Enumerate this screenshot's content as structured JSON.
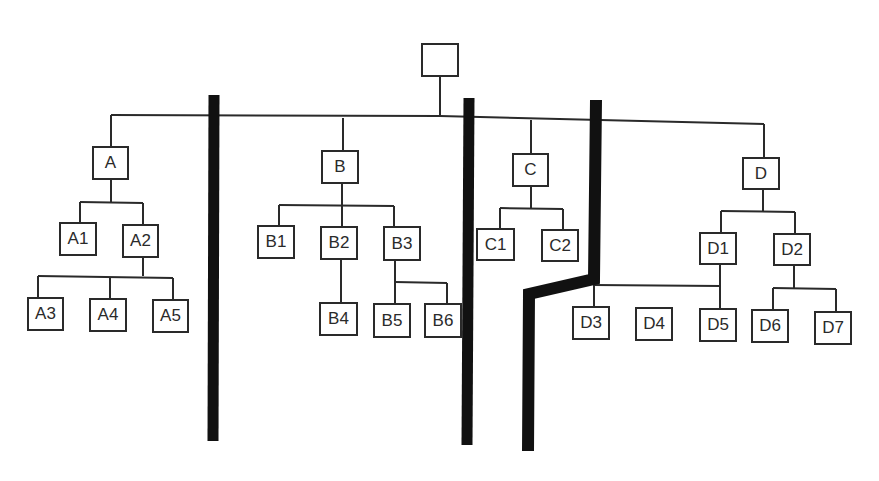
{
  "diagram": {
    "type": "org-chart-partitioned",
    "colors": {
      "line": "#2a2a2a",
      "divider": "#111111",
      "background": "#ffffff"
    },
    "root": {
      "id": "root",
      "label": "",
      "x": 421,
      "y": 43,
      "w": 38,
      "h": 34
    },
    "nodes": [
      {
        "id": "A",
        "label": "A",
        "x": 92,
        "y": 146,
        "w": 37,
        "h": 34
      },
      {
        "id": "A1",
        "label": "A1",
        "x": 59,
        "y": 222,
        "w": 38,
        "h": 34
      },
      {
        "id": "A2",
        "label": "A2",
        "x": 122,
        "y": 224,
        "w": 37,
        "h": 34
      },
      {
        "id": "A3",
        "label": "A3",
        "x": 27,
        "y": 297,
        "w": 37,
        "h": 34
      },
      {
        "id": "A4",
        "label": "A4",
        "x": 89,
        "y": 298,
        "w": 38,
        "h": 34
      },
      {
        "id": "A5",
        "label": "A5",
        "x": 152,
        "y": 299,
        "w": 37,
        "h": 34
      },
      {
        "id": "B",
        "label": "B",
        "x": 321,
        "y": 150,
        "w": 38,
        "h": 34
      },
      {
        "id": "B1",
        "label": "B1",
        "x": 257,
        "y": 225,
        "w": 38,
        "h": 34
      },
      {
        "id": "B2",
        "label": "B2",
        "x": 320,
        "y": 226,
        "w": 38,
        "h": 34
      },
      {
        "id": "B3",
        "label": "B3",
        "x": 383,
        "y": 226,
        "w": 38,
        "h": 35
      },
      {
        "id": "B4",
        "label": "B4",
        "x": 319,
        "y": 302,
        "w": 39,
        "h": 34
      },
      {
        "id": "B5",
        "label": "B5",
        "x": 373,
        "y": 303,
        "w": 38,
        "h": 35
      },
      {
        "id": "B6",
        "label": "B6",
        "x": 424,
        "y": 303,
        "w": 38,
        "h": 35
      },
      {
        "id": "C",
        "label": "C",
        "x": 512,
        "y": 153,
        "w": 37,
        "h": 34
      },
      {
        "id": "C1",
        "label": "C1",
        "x": 476,
        "y": 228,
        "w": 39,
        "h": 33
      },
      {
        "id": "C2",
        "label": "C2",
        "x": 541,
        "y": 229,
        "w": 38,
        "h": 33
      },
      {
        "id": "D",
        "label": "D",
        "x": 742,
        "y": 157,
        "w": 38,
        "h": 33
      },
      {
        "id": "D1",
        "label": "D1",
        "x": 699,
        "y": 232,
        "w": 38,
        "h": 33
      },
      {
        "id": "D2",
        "label": "D2",
        "x": 773,
        "y": 233,
        "w": 38,
        "h": 33
      },
      {
        "id": "D3",
        "label": "D3",
        "x": 572,
        "y": 306,
        "w": 38,
        "h": 34
      },
      {
        "id": "D4",
        "label": "D4",
        "x": 635,
        "y": 307,
        "w": 38,
        "h": 34
      },
      {
        "id": "D5",
        "label": "D5",
        "x": 699,
        "y": 308,
        "w": 38,
        "h": 34
      },
      {
        "id": "D6",
        "label": "D6",
        "x": 751,
        "y": 309,
        "w": 38,
        "h": 34
      },
      {
        "id": "D7",
        "label": "D7",
        "x": 814,
        "y": 311,
        "w": 38,
        "h": 34
      }
    ],
    "edges": [
      [
        "root",
        "A"
      ],
      [
        "root",
        "B"
      ],
      [
        "root",
        "C"
      ],
      [
        "root",
        "D"
      ],
      [
        "A",
        "A1"
      ],
      [
        "A",
        "A2"
      ],
      [
        "A2",
        "A3"
      ],
      [
        "A2",
        "A4"
      ],
      [
        "A2",
        "A5"
      ],
      [
        "B",
        "B1"
      ],
      [
        "B",
        "B2"
      ],
      [
        "B",
        "B3"
      ],
      [
        "B2",
        "B4"
      ],
      [
        "B3",
        "B5"
      ],
      [
        "B3",
        "B6"
      ],
      [
        "C",
        "C1"
      ],
      [
        "C",
        "C2"
      ],
      [
        "D",
        "D1"
      ],
      [
        "D",
        "D2"
      ],
      [
        "D1",
        "D3"
      ],
      [
        "D1",
        "D5"
      ],
      [
        "D2",
        "D6"
      ],
      [
        "D2",
        "D7"
      ]
    ],
    "connector_lines": [
      {
        "name": "root-drop",
        "points": [
          [
            440,
            77
          ],
          [
            440,
            115
          ]
        ]
      },
      {
        "name": "root-bus",
        "points": [
          [
            111,
            115
          ],
          [
            440,
            116
          ],
          [
            764,
            124
          ]
        ]
      },
      {
        "name": "bus-to-A",
        "points": [
          [
            111,
            115
          ],
          [
            111,
            146
          ]
        ]
      },
      {
        "name": "bus-to-B",
        "points": [
          [
            343,
            118
          ],
          [
            343,
            150
          ]
        ]
      },
      {
        "name": "bus-to-C",
        "points": [
          [
            531,
            120
          ],
          [
            531,
            153
          ]
        ]
      },
      {
        "name": "bus-to-D",
        "points": [
          [
            764,
            124
          ],
          [
            764,
            157
          ]
        ]
      },
      {
        "name": "A-drop",
        "points": [
          [
            111,
            180
          ],
          [
            111,
            202
          ]
        ]
      },
      {
        "name": "A-bus",
        "points": [
          [
            80,
            202
          ],
          [
            143,
            203
          ]
        ]
      },
      {
        "name": "A-to-A1",
        "points": [
          [
            80,
            202
          ],
          [
            80,
            222
          ]
        ]
      },
      {
        "name": "A-to-A2",
        "points": [
          [
            143,
            203
          ],
          [
            143,
            224
          ]
        ]
      },
      {
        "name": "A2-drop",
        "points": [
          [
            143,
            258
          ],
          [
            143,
            276
          ]
        ]
      },
      {
        "name": "A2-bus",
        "points": [
          [
            38,
            276
          ],
          [
            173,
            278
          ]
        ]
      },
      {
        "name": "A2-to-A3",
        "points": [
          [
            38,
            276
          ],
          [
            38,
            297
          ]
        ]
      },
      {
        "name": "A2-to-A4",
        "points": [
          [
            110,
            277
          ],
          [
            110,
            298
          ]
        ]
      },
      {
        "name": "A2-to-A5",
        "points": [
          [
            173,
            278
          ],
          [
            173,
            299
          ]
        ]
      },
      {
        "name": "B-drop",
        "points": [
          [
            342,
            184
          ],
          [
            342,
            205
          ]
        ]
      },
      {
        "name": "B-bus",
        "points": [
          [
            279,
            205
          ],
          [
            394,
            206
          ]
        ]
      },
      {
        "name": "B-to-B1",
        "points": [
          [
            279,
            205
          ],
          [
            279,
            225
          ]
        ]
      },
      {
        "name": "B-to-B2",
        "points": [
          [
            342,
            205
          ],
          [
            342,
            226
          ]
        ]
      },
      {
        "name": "B-to-B3",
        "points": [
          [
            394,
            206
          ],
          [
            394,
            226
          ]
        ]
      },
      {
        "name": "B2-to-B4",
        "points": [
          [
            341,
            260
          ],
          [
            341,
            302
          ]
        ]
      },
      {
        "name": "B3-drop",
        "points": [
          [
            395,
            261
          ],
          [
            395,
            282
          ]
        ]
      },
      {
        "name": "B3-bus",
        "points": [
          [
            395,
            282
          ],
          [
            447,
            283
          ]
        ]
      },
      {
        "name": "B3-to-B5",
        "points": [
          [
            395,
            282
          ],
          [
            395,
            303
          ]
        ]
      },
      {
        "name": "B3-to-B6",
        "points": [
          [
            447,
            283
          ],
          [
            447,
            303
          ]
        ]
      },
      {
        "name": "C-drop",
        "points": [
          [
            531,
            187
          ],
          [
            531,
            208
          ]
        ]
      },
      {
        "name": "C-bus",
        "points": [
          [
            500,
            208
          ],
          [
            563,
            209
          ]
        ]
      },
      {
        "name": "C-to-C1",
        "points": [
          [
            500,
            208
          ],
          [
            500,
            228
          ]
        ]
      },
      {
        "name": "C-to-C2",
        "points": [
          [
            563,
            209
          ],
          [
            563,
            229
          ]
        ]
      },
      {
        "name": "D-drop",
        "points": [
          [
            763,
            190
          ],
          [
            763,
            211
          ]
        ]
      },
      {
        "name": "D-bus",
        "points": [
          [
            721,
            211
          ],
          [
            795,
            212
          ]
        ]
      },
      {
        "name": "D-to-D1",
        "points": [
          [
            721,
            211
          ],
          [
            721,
            232
          ]
        ]
      },
      {
        "name": "D-to-D2",
        "points": [
          [
            795,
            212
          ],
          [
            795,
            233
          ]
        ]
      },
      {
        "name": "D1-drop",
        "points": [
          [
            720,
            265
          ],
          [
            720,
            308
          ]
        ]
      },
      {
        "name": "D1-bus",
        "points": [
          [
            594,
            285
          ],
          [
            720,
            286
          ]
        ]
      },
      {
        "name": "D1-to-D3",
        "points": [
          [
            594,
            285
          ],
          [
            594,
            306
          ]
        ]
      },
      {
        "name": "D2-drop",
        "points": [
          [
            794,
            266
          ],
          [
            794,
            288
          ]
        ]
      },
      {
        "name": "D2-bus",
        "points": [
          [
            773,
            288
          ],
          [
            836,
            289
          ]
        ]
      },
      {
        "name": "D2-to-D6",
        "points": [
          [
            773,
            288
          ],
          [
            773,
            309
          ]
        ]
      },
      {
        "name": "D2-to-D7",
        "points": [
          [
            836,
            289
          ],
          [
            836,
            311
          ]
        ]
      }
    ],
    "dividers": [
      {
        "name": "divider-1",
        "width": 11,
        "points": [
          [
            214,
            95
          ],
          [
            213,
            441
          ]
        ]
      },
      {
        "name": "divider-2",
        "width": 11,
        "points": [
          [
            469,
            98
          ],
          [
            467,
            445
          ]
        ]
      },
      {
        "name": "divider-3",
        "width": 12,
        "points": [
          [
            596,
            100
          ],
          [
            594,
            279
          ],
          [
            529,
            294
          ],
          [
            528,
            451
          ]
        ]
      }
    ]
  }
}
